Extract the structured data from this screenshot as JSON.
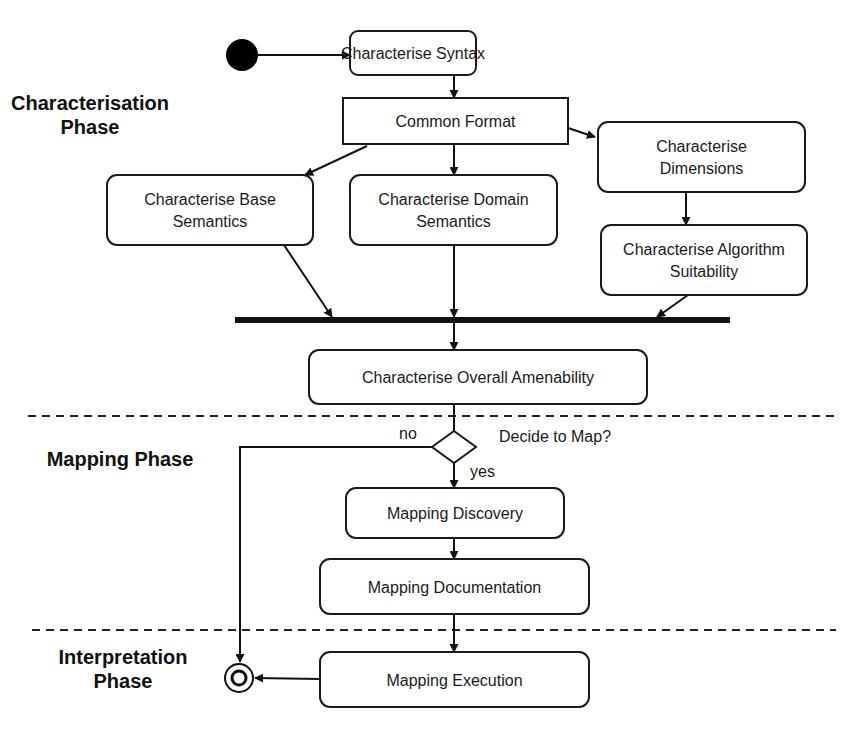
{
  "colors": {
    "stroke": "#111111",
    "background": "#ffffff"
  },
  "phases": [
    {
      "id": "characterisation",
      "lines": [
        "Characterisation",
        "Phase"
      ],
      "x": 90,
      "y": 110
    },
    {
      "id": "mapping",
      "lines": [
        "Mapping Phase"
      ],
      "x": 120,
      "y": 466
    },
    {
      "id": "interpretation",
      "lines": [
        "Interpretation",
        "Phase"
      ],
      "x": 123,
      "y": 664
    }
  ],
  "dividers": [
    {
      "y": 416,
      "x1": 28,
      "x2": 834
    },
    {
      "y": 630,
      "x1": 32,
      "x2": 836
    }
  ],
  "nodes": [
    {
      "id": "characterise-syntax",
      "lines": [
        "Characterise Syntax"
      ],
      "x": 350,
      "y": 31,
      "w": 126,
      "h": 44,
      "r": 8
    },
    {
      "id": "common-format",
      "lines": [
        "Common Format"
      ],
      "x": 343,
      "y": 98,
      "w": 225,
      "h": 46,
      "r": 0
    },
    {
      "id": "characterise-dimensions",
      "lines": [
        "Characterise",
        "Dimensions"
      ],
      "x": 598,
      "y": 122,
      "w": 207,
      "h": 70,
      "r": 10
    },
    {
      "id": "characterise-base-semantics",
      "lines": [
        "Characterise Base",
        "Semantics"
      ],
      "x": 107,
      "y": 175,
      "w": 206,
      "h": 70,
      "r": 10
    },
    {
      "id": "characterise-domain-semantics",
      "lines": [
        "Characterise Domain",
        "Semantics"
      ],
      "x": 350,
      "y": 175,
      "w": 207,
      "h": 70,
      "r": 10
    },
    {
      "id": "characterise-algorithm-suitability",
      "lines": [
        "Characterise Algorithm",
        "Suitability"
      ],
      "x": 601,
      "y": 225,
      "w": 206,
      "h": 70,
      "r": 10
    },
    {
      "id": "characterise-overall-amenability",
      "lines": [
        "Characterise Overall Amenability"
      ],
      "x": 309,
      "y": 350,
      "w": 338,
      "h": 54,
      "r": 10
    },
    {
      "id": "mapping-discovery",
      "lines": [
        "Mapping Discovery"
      ],
      "x": 346,
      "y": 488,
      "w": 218,
      "h": 50,
      "r": 10
    },
    {
      "id": "mapping-documentation",
      "lines": [
        "Mapping Documentation"
      ],
      "x": 320,
      "y": 559,
      "w": 269,
      "h": 55,
      "r": 10
    },
    {
      "id": "mapping-execution",
      "lines": [
        "Mapping Execution"
      ],
      "x": 320,
      "y": 652,
      "w": 269,
      "h": 55,
      "r": 10
    }
  ],
  "start_node": {
    "cx": 242,
    "cy": 55,
    "r": 16
  },
  "end_node": {
    "cx": 239,
    "cy": 678,
    "r_outer": 14,
    "r_inner": 7
  },
  "join_bar": {
    "x1": 235,
    "x2": 730,
    "y": 320,
    "thickness": 6
  },
  "decision": {
    "cx": 454,
    "cy": 447,
    "hw": 22,
    "hh": 16,
    "question": "Decide to Map?",
    "no_label": "no",
    "yes_label": "yes"
  },
  "edges": [
    {
      "id": "start-to-syntax",
      "points": [
        [
          258,
          55
        ],
        [
          350,
          55
        ]
      ]
    },
    {
      "id": "syntax-to-format",
      "points": [
        [
          454,
          75
        ],
        [
          454,
          98
        ]
      ]
    },
    {
      "id": "format-to-base",
      "points": [
        [
          367,
          146
        ],
        [
          305,
          175
        ]
      ]
    },
    {
      "id": "format-to-domain",
      "points": [
        [
          454,
          144
        ],
        [
          454,
          175
        ]
      ]
    },
    {
      "id": "format-to-dimensions",
      "points": [
        [
          565,
          127
        ],
        [
          595,
          137
        ]
      ]
    },
    {
      "id": "dimensions-to-algorithm",
      "points": [
        [
          686,
          192
        ],
        [
          686,
          225
        ]
      ]
    },
    {
      "id": "base-to-bar",
      "points": [
        [
          284,
          245
        ],
        [
          332,
          317
        ]
      ]
    },
    {
      "id": "domain-to-bar",
      "points": [
        [
          454,
          245
        ],
        [
          454,
          317
        ]
      ]
    },
    {
      "id": "algorithm-to-bar",
      "points": [
        [
          688,
          295
        ],
        [
          657,
          317
        ]
      ]
    },
    {
      "id": "bar-to-amenability",
      "points": [
        [
          454,
          323
        ],
        [
          454,
          350
        ]
      ]
    },
    {
      "id": "amenability-to-decision",
      "points": [
        [
          454,
          404
        ],
        [
          454,
          431
        ]
      ],
      "arrow": false
    },
    {
      "id": "decision-yes-to-discovery",
      "points": [
        [
          454,
          463
        ],
        [
          454,
          488
        ]
      ]
    },
    {
      "id": "decision-no-to-end",
      "points": [
        [
          432,
          447
        ],
        [
          240,
          447
        ],
        [
          240,
          662
        ]
      ]
    },
    {
      "id": "discovery-to-documentation",
      "points": [
        [
          454,
          538
        ],
        [
          454,
          559
        ]
      ]
    },
    {
      "id": "documentation-to-execution",
      "points": [
        [
          454,
          614
        ],
        [
          454,
          652
        ]
      ]
    },
    {
      "id": "execution-to-end",
      "points": [
        [
          320,
          679
        ],
        [
          255,
          678
        ]
      ]
    }
  ]
}
